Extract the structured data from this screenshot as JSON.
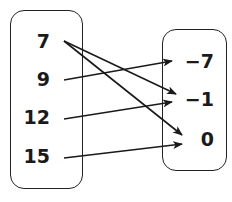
{
  "domain_set": {
    "values": [
      "7",
      "9",
      "12",
      "15"
    ],
    "positions": [
      [
        10,
        32
      ],
      [
        10,
        70
      ],
      [
        10,
        108
      ],
      [
        10,
        147
      ]
    ]
  },
  "range_set": {
    "values": [
      "−7",
      "−1",
      "0"
    ],
    "positions": [
      [
        174,
        52
      ],
      [
        174,
        90
      ],
      [
        174,
        130
      ]
    ]
  },
  "mappings": [
    {
      "from": "7",
      "to": "−1",
      "x1": 64,
      "y1": 41,
      "x2": 176,
      "y2": 94
    },
    {
      "from": "7",
      "to": "0",
      "x1": 64,
      "y1": 41,
      "x2": 182,
      "y2": 135
    },
    {
      "from": "9",
      "to": "−7",
      "x1": 64,
      "y1": 80,
      "x2": 172,
      "y2": 61
    },
    {
      "from": "12",
      "to": "−1",
      "x1": 64,
      "y1": 119,
      "x2": 172,
      "y2": 102
    },
    {
      "from": "15",
      "to": "0",
      "x1": 64,
      "y1": 158,
      "x2": 182,
      "y2": 144
    }
  ],
  "colors": {
    "stroke": "#1a1a1a",
    "text": "#1a1a1a",
    "background": "#ffffff"
  }
}
